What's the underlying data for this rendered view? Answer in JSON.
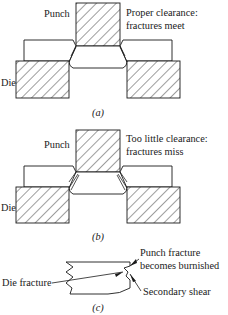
{
  "figure": {
    "type": "technical-diagram",
    "panels": [
      {
        "id": "a",
        "panel_label": "(a)",
        "caption": {
          "line1": "Proper clearance:",
          "line2": "fractures meet"
        },
        "labels": {
          "punch": "Punch",
          "die": "Die"
        },
        "description": "Punch descending into sheet supported by die; fracture lines from punch edge and die edge meet, producing a clean separated slug."
      },
      {
        "id": "b",
        "panel_label": "(b)",
        "caption": {
          "line1": "Too little clearance:",
          "line2": "fractures miss"
        },
        "labels": {
          "punch": "Punch",
          "die": "Die"
        },
        "description": "Punch descending into sheet with insufficient clearance; fracture lines from punch and die do not align and miss each other."
      },
      {
        "id": "c",
        "panel_label": "(c)",
        "labels": {
          "punch_fracture_line1": "Punch fracture",
          "punch_fracture_line2": "becomes burnished",
          "die_fracture": "Die fracture",
          "secondary_shear": "Secondary shear"
        },
        "description": "Detail of sheared edge cross-section showing die fracture on the left wavy surface, punch fracture burnished region, and secondary shear step."
      }
    ]
  },
  "style": {
    "line_color": "#1a1a1a",
    "fill_color": "#ffffff",
    "background": "#ffffff"
  }
}
